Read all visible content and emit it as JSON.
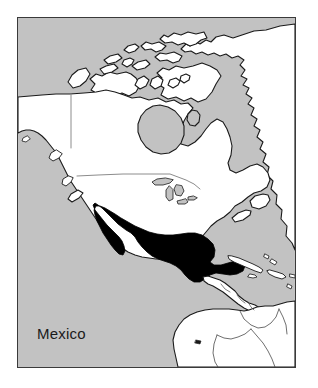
{
  "figure": {
    "type": "thematic-locator-map",
    "region_depicted": "North America",
    "projection_hint": "conic",
    "width_px": 318,
    "height_px": 388,
    "background_color": "#ffffff"
  },
  "frame": {
    "border_color": "#3a3a3a",
    "border_width_px": 1,
    "left_px": 17,
    "top_px": 17,
    "width_px": 279,
    "height_px": 351
  },
  "legend_colors": {
    "ocean": "#c2c2c2",
    "land": "#ffffff",
    "highlight": "#000000",
    "coastline": "#1a1a1a",
    "internal_border": "#8c8c8c"
  },
  "label": {
    "text": "Mexico",
    "color": "#1a1a1a",
    "font_size_px": 15,
    "x_px": 37,
    "y_px": 325
  },
  "highlighted_country": {
    "name": "Mexico",
    "fill": "#000000",
    "includes": [
      "Baja California peninsula",
      "Yucatan peninsula",
      "Gulf of California"
    ]
  },
  "depicted_features": {
    "landmasses": [
      "Alaska",
      "Canada",
      "Canadian Arctic Archipelago",
      "Greenland (west coast)",
      "United States",
      "Mexico",
      "Central America",
      "Northern South America"
    ],
    "water_bodies": [
      "Pacific Ocean",
      "Atlantic Ocean",
      "Arctic Ocean",
      "Hudson Bay",
      "Gulf of Mexico",
      "Caribbean Sea",
      "Great Lakes"
    ],
    "islands": [
      "Cuba",
      "Hispaniola",
      "Puerto Rico",
      "Jamaica",
      "Bahamas",
      "Newfoundland",
      "Vancouver Island",
      "Baffin Island",
      "Victoria Island",
      "Ellesmere Island",
      "Galapagos Islands"
    ],
    "political_borders": [
      "Alaska - Canada (141st meridian)",
      "United States - Canada (49th parallel)",
      "Colombia - Venezuela",
      "Colombia - Ecuador",
      "Colombia - Peru",
      "Central American republics"
    ]
  }
}
